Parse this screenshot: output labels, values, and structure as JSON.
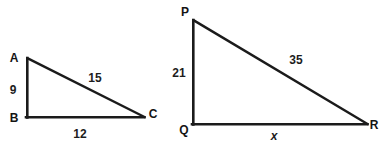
{
  "figure": {
    "background_color": "#ffffff",
    "stroke_color": "#1b1b1b",
    "text_color": "#141414"
  },
  "triangles": [
    {
      "id": "triangle-abc",
      "name": "ABC",
      "vertices": [
        {
          "label": "A",
          "x": 27,
          "y": 58,
          "label_x": 14,
          "label_y": 62
        },
        {
          "label": "B",
          "x": 27,
          "y": 117,
          "label_x": 14,
          "label_y": 122
        },
        {
          "label": "C",
          "x": 144,
          "y": 117,
          "label_x": 150,
          "label_y": 118
        }
      ],
      "sides": [
        {
          "name": "leg-vertical",
          "label": "9",
          "label_x": 9,
          "label_y": 94
        },
        {
          "name": "hypotenuse",
          "label": "15",
          "label_x": 88,
          "label_y": 82
        },
        {
          "name": "leg-horizontal",
          "label": "12",
          "label_x": 73,
          "label_y": 138
        }
      ]
    },
    {
      "id": "triangle-pqr",
      "name": "PQR",
      "vertices": [
        {
          "label": "P",
          "x": 193,
          "y": 20,
          "label_x": 184,
          "label_y": 16
        },
        {
          "label": "Q",
          "x": 193,
          "y": 124,
          "label_x": 182,
          "label_y": 134
        },
        {
          "label": "R",
          "x": 367,
          "y": 124,
          "label_x": 371,
          "label_y": 129
        }
      ],
      "sides": [
        {
          "name": "leg-vertical",
          "label": "21",
          "label_x": 172,
          "label_y": 77
        },
        {
          "name": "hypotenuse",
          "label": "35",
          "label_x": 289,
          "label_y": 64
        },
        {
          "name": "leg-horizontal",
          "label": "x",
          "label_x": 271,
          "label_y": 140
        }
      ]
    }
  ]
}
